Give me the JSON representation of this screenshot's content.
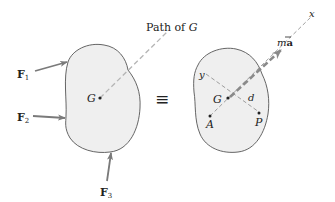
{
  "diagram": {
    "equivalence_symbol": "≡",
    "path_label": "Path of",
    "path_label_var": "G",
    "colors": {
      "blob_fill": "#efefef",
      "blob_stroke": "#555555",
      "arrow": "#7a7a7a",
      "dashed": "#b5b5b5",
      "text": "#222222"
    },
    "left_body": {
      "center_label": "G",
      "forces": [
        {
          "name": "F",
          "sub": "1"
        },
        {
          "name": "F",
          "sub": "2"
        },
        {
          "name": "F",
          "sub": "3"
        }
      ]
    },
    "right_body": {
      "center_label": "G",
      "resultant_label": "m",
      "resultant_vec": "a",
      "resultant_bar": "‾",
      "x_axis_label": "x",
      "y_axis_label": "y",
      "distance_label": "d",
      "point_a_label": "A",
      "point_p_label": "P"
    }
  }
}
